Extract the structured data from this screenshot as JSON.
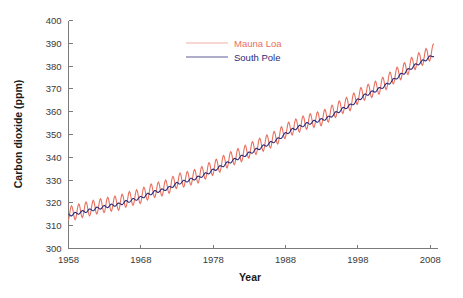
{
  "chart_data": {
    "type": "line",
    "title": "",
    "xlabel": "Year",
    "ylabel": "Carbon dioxide (ppm)",
    "xlim": [
      1958,
      2009
    ],
    "ylim": [
      300,
      400
    ],
    "xticks": [
      1958,
      1968,
      1978,
      1988,
      1998,
      2008
    ],
    "yticks": [
      300,
      310,
      320,
      330,
      340,
      350,
      360,
      370,
      380,
      390,
      400
    ],
    "xtick_labels": [
      "1958",
      "1968",
      "1978",
      "1988",
      "1998",
      "2008"
    ],
    "ytick_labels": [
      "300",
      "310",
      "320",
      "330",
      "340",
      "350",
      "360",
      "370",
      "380",
      "390",
      "400"
    ],
    "grid": false,
    "legend_position": "upper-center",
    "series": [
      {
        "name": "Mauna Loa",
        "color": "#e8705f",
        "seasonal_amplitude": 3.2,
        "seasonal_phase_months": 5,
        "annual_mean": {
          "x": [
            1958,
            1959,
            1960,
            1961,
            1962,
            1963,
            1964,
            1965,
            1966,
            1967,
            1968,
            1969,
            1970,
            1971,
            1972,
            1973,
            1974,
            1975,
            1976,
            1977,
            1978,
            1979,
            1980,
            1981,
            1982,
            1983,
            1984,
            1985,
            1986,
            1987,
            1988,
            1989,
            1990,
            1991,
            1992,
            1993,
            1994,
            1995,
            1996,
            1997,
            1998,
            1999,
            2000,
            2001,
            2002,
            2003,
            2004,
            2005,
            2006,
            2007,
            2008
          ],
          "y": [
            315.3,
            315.9,
            316.9,
            317.6,
            318.4,
            319.0,
            319.6,
            320.0,
            321.4,
            322.2,
            323.0,
            324.6,
            325.7,
            326.3,
            327.5,
            329.7,
            330.2,
            331.1,
            332.0,
            333.8,
            335.4,
            336.8,
            338.7,
            340.1,
            341.4,
            343.0,
            344.6,
            346.0,
            347.4,
            349.2,
            351.6,
            353.1,
            354.4,
            355.6,
            356.4,
            357.1,
            358.8,
            360.8,
            362.6,
            363.7,
            366.7,
            368.4,
            369.5,
            371.0,
            373.1,
            375.6,
            377.4,
            379.7,
            381.9,
            383.7,
            385.6
          ]
        }
      },
      {
        "name": "South Pole",
        "color": "#2b2b78",
        "seasonal_amplitude": 0.6,
        "seasonal_phase_months": 11,
        "annual_mean": {
          "x": [
            1958,
            1959,
            1960,
            1961,
            1962,
            1963,
            1964,
            1965,
            1966,
            1967,
            1968,
            1969,
            1970,
            1971,
            1972,
            1973,
            1974,
            1975,
            1976,
            1977,
            1978,
            1979,
            1980,
            1981,
            1982,
            1983,
            1984,
            1985,
            1986,
            1987,
            1988,
            1989,
            1990,
            1991,
            1992,
            1993,
            1994,
            1995,
            1996,
            1997,
            1998,
            1999,
            2000,
            2001,
            2002,
            2003,
            2004,
            2005,
            2006,
            2007,
            2008
          ],
          "y": [
            314.6,
            315.3,
            316.1,
            316.8,
            317.6,
            318.3,
            318.9,
            319.4,
            320.5,
            321.4,
            322.3,
            323.7,
            324.9,
            325.6,
            326.7,
            328.5,
            329.4,
            330.3,
            331.2,
            332.7,
            334.3,
            335.8,
            337.5,
            339.0,
            340.4,
            341.8,
            343.4,
            344.9,
            346.4,
            348.0,
            350.3,
            352.2,
            353.5,
            354.7,
            355.7,
            356.4,
            357.5,
            359.5,
            361.4,
            362.8,
            365.1,
            367.3,
            368.6,
            370.1,
            371.9,
            374.1,
            376.3,
            378.4,
            380.5,
            382.2,
            384.0
          ]
        }
      }
    ],
    "legend": [
      {
        "label": "Mauna Loa",
        "color": "#e8705f"
      },
      {
        "label": "South Pole",
        "color": "#2b2b78"
      }
    ],
    "axis_color": "#7b7b7b"
  }
}
